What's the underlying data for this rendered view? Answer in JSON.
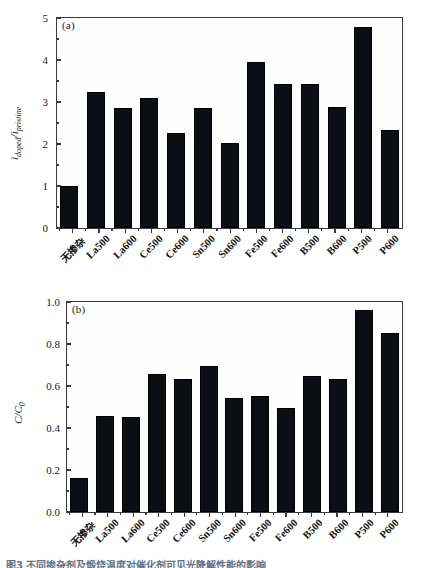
{
  "figure": {
    "caption_partial": "图3 不同掺杂剂及煅烧温度对催化剂可见光降解性能的影响"
  },
  "colors": {
    "bar": "#0b0f14",
    "axis": "#3a3a3a",
    "text": "#1a1a1a",
    "caption": "#2b3f63",
    "background": "#ffffff"
  },
  "panels": [
    {
      "tag": "(a)",
      "ylabel": "i",
      "ylabel_sub1": "doped",
      "ylabel_sep": "/i",
      "ylabel_sub2": "pristine"
    },
    {
      "tag": "(b)",
      "ylabel": "C/C",
      "ylabel_sub": "0"
    }
  ],
  "chart_data": [
    {
      "type": "bar",
      "title": "(a)",
      "xlabel": "",
      "ylabel": "i_doped / i_pristine",
      "ylim": [
        0,
        5
      ],
      "yticks": [
        0,
        1,
        2,
        3,
        4,
        5
      ],
      "ytick_labels": [
        "0",
        "1",
        "2",
        "3",
        "4",
        "5"
      ],
      "minor_ticks": true,
      "grid": false,
      "legend": "none",
      "categories": [
        "无掺杂",
        "La500",
        "La600",
        "Ce500",
        "Ce600",
        "Sn500",
        "Sn600",
        "Fe500",
        "Fe600",
        "B500",
        "B600",
        "P500",
        "P600"
      ],
      "values": [
        1.01,
        3.24,
        2.85,
        3.09,
        2.27,
        2.85,
        2.02,
        3.96,
        3.43,
        3.42,
        2.89,
        4.79,
        2.34
      ]
    },
    {
      "type": "bar",
      "title": "(b)",
      "xlabel": "",
      "ylabel": "C/C0",
      "ylim": [
        0.0,
        1.0
      ],
      "yticks": [
        0.0,
        0.2,
        0.4,
        0.6,
        0.8,
        1.0
      ],
      "ytick_labels": [
        "0.0",
        "0.2",
        "0.4",
        "0.6",
        "0.8",
        "1.0"
      ],
      "minor_ticks": true,
      "grid": false,
      "legend": "none",
      "categories": [
        "无掺杂",
        "La500",
        "La600",
        "Ce500",
        "Ce600",
        "Sn500",
        "Sn600",
        "Fe500",
        "Fe600",
        "B500",
        "B600",
        "P500",
        "P600"
      ],
      "values": [
        0.163,
        0.456,
        0.451,
        0.657,
        0.633,
        0.697,
        0.541,
        0.551,
        0.493,
        0.647,
        0.633,
        0.963,
        0.852
      ]
    }
  ]
}
